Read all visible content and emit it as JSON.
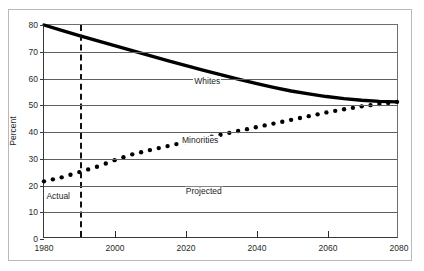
{
  "chart_data": {
    "type": "line",
    "title": "",
    "subtitle": "",
    "xlabel": "",
    "ylabel": "Percent",
    "xlim": [
      1980,
      2080
    ],
    "ylim": [
      0,
      80
    ],
    "xticks": [
      1980,
      2000,
      2020,
      2040,
      2060,
      2080
    ],
    "yticks": [
      0,
      10,
      20,
      30,
      40,
      50,
      60,
      70,
      80
    ],
    "grid": "horizontal",
    "legend_position": "inline-annotations",
    "annotations": [
      {
        "text": "Whites",
        "x": 2026,
        "y": 59,
        "role": "series-label"
      },
      {
        "text": "Minorities",
        "x": 2024,
        "y": 37,
        "role": "series-label"
      },
      {
        "text": "Actual",
        "x": 1984,
        "y": 16,
        "role": "region-label"
      },
      {
        "text": "Projected",
        "x": 2025,
        "y": 18,
        "role": "region-label"
      }
    ],
    "reference_lines": [
      {
        "type": "vertical",
        "x": 1990,
        "style": "dashed",
        "color": "#111111",
        "label_left": "Actual",
        "label_right": "Projected"
      }
    ],
    "series": [
      {
        "name": "Whites",
        "style": "solid-thick",
        "color": "#000000",
        "x": [
          1980,
          1985,
          1990,
          1995,
          2000,
          2005,
          2010,
          2015,
          2020,
          2025,
          2030,
          2035,
          2040,
          2045,
          2050,
          2055,
          2060,
          2065,
          2070,
          2075,
          2080
        ],
        "values": [
          80.0,
          78.0,
          76.0,
          74.1,
          72.2,
          70.3,
          68.4,
          66.6,
          64.8,
          63.0,
          61.3,
          59.6,
          58.0,
          56.5,
          55.1,
          54.0,
          53.0,
          52.2,
          51.6,
          51.2,
          51.0
        ]
      },
      {
        "name": "Minorities",
        "style": "dotted",
        "color": "#000000",
        "x": [
          1980,
          1985,
          1990,
          1995,
          2000,
          2005,
          2010,
          2015,
          2020,
          2025,
          2030,
          2035,
          2040,
          2045,
          2050,
          2055,
          2060,
          2065,
          2070,
          2075,
          2080
        ],
        "values": [
          21.0,
          22.5,
          24.5,
          26.5,
          29.0,
          31.2,
          32.8,
          34.3,
          35.8,
          37.2,
          38.6,
          40.0,
          41.4,
          42.8,
          44.2,
          45.6,
          47.0,
          48.2,
          49.3,
          50.2,
          51.0
        ]
      }
    ]
  }
}
